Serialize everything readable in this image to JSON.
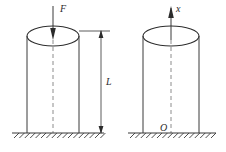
{
  "figure": {
    "background_color": "#ffffff",
    "line_color": "#3a3a3a",
    "dashed_color": "#8c8c8c",
    "label_color": "#2b2b2b"
  },
  "left_panel": {
    "name": "loaded-column",
    "force_label": "F",
    "length_label": "L",
    "force_direction": "down",
    "cylinder": {
      "left_x": 27,
      "right_x": 79,
      "top_y": 36,
      "bottom_y": 133,
      "ellipse_rx": 26,
      "ellipse_ry": 10
    },
    "ground": {
      "x_start": 12,
      "x_end": 104,
      "y": 133,
      "hatch_count": 17
    },
    "dimension": {
      "x": 101,
      "top_y": 31,
      "bottom_y": 133,
      "label": "L"
    }
  },
  "right_panel": {
    "name": "coordinate-column",
    "axis_label": "x",
    "origin_label": "O",
    "axis_direction": "up",
    "cylinder": {
      "left_x": 143,
      "right_x": 199,
      "top_y": 36,
      "bottom_y": 133,
      "ellipse_rx": 28,
      "ellipse_ry": 10
    },
    "ground": {
      "x_start": 128,
      "x_end": 216,
      "y": 133,
      "hatch_count": 16
    }
  }
}
